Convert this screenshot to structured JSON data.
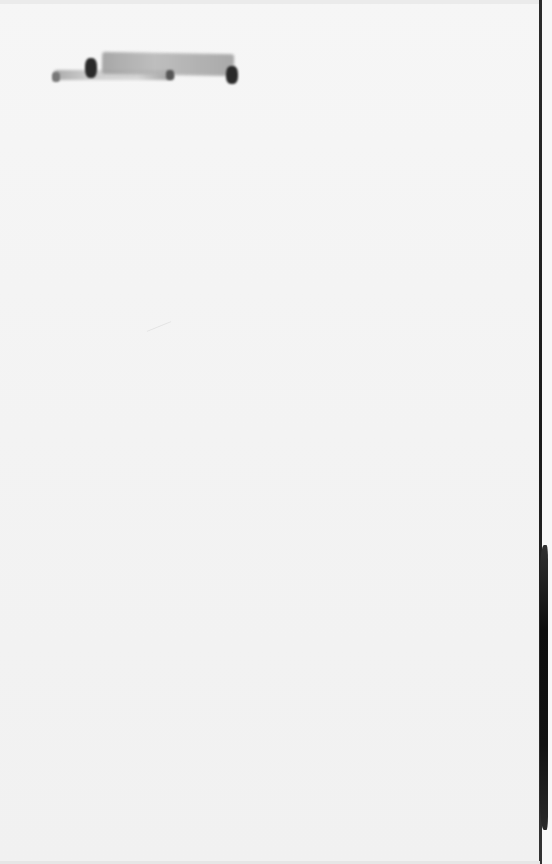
{
  "document": {
    "type": "scanned-blank-page",
    "text_content": "",
    "marks": [
      {
        "kind": "redaction-smudge",
        "position": "top-left"
      },
      {
        "kind": "binding-shadow",
        "position": "right-edge"
      }
    ]
  }
}
